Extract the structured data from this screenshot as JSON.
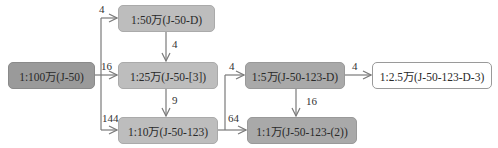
{
  "diagram": {
    "type": "map-sheet-hierarchy",
    "nodes": [
      {
        "id": "n100w",
        "label": "1:100万(J-50)",
        "style": "dark"
      },
      {
        "id": "n50w",
        "label": "1:50万(J-50-D)",
        "style": "mid"
      },
      {
        "id": "n25w",
        "label": "1:25万(J-50-[3])",
        "style": "mid"
      },
      {
        "id": "n10w",
        "label": "1:10万(J-50-123)",
        "style": "mid"
      },
      {
        "id": "n5w",
        "label": "1:5万(J-50-123-D)",
        "style": "mid2"
      },
      {
        "id": "n1w",
        "label": "1:1万(J-50-123-(2))",
        "style": "mid2"
      },
      {
        "id": "n25k",
        "label": "1:2.5万(J-50-123-D-3)",
        "style": "white"
      }
    ],
    "edges": [
      {
        "from": "n100w",
        "to": "n50w",
        "label": "4"
      },
      {
        "from": "n100w",
        "to": "n25w",
        "label": "16"
      },
      {
        "from": "n100w",
        "to": "n10w",
        "label": "144"
      },
      {
        "from": "n50w",
        "to": "n25w",
        "label": "4"
      },
      {
        "from": "n25w",
        "to": "n10w",
        "label": "9"
      },
      {
        "from": "n10w",
        "to": "n5w",
        "label": "4"
      },
      {
        "from": "n10w",
        "to": "n1w",
        "label": "64"
      },
      {
        "from": "n5w",
        "to": "n25k",
        "label": "4"
      },
      {
        "from": "n5w",
        "to": "n1w",
        "label": "16"
      }
    ],
    "colors": {
      "dark_node": "#9a9a9a",
      "mid_node": "#bdbdbd",
      "mid2_node": "#a9a9a9",
      "white_node": "#ffffff",
      "line": "#7a7a7a"
    }
  }
}
